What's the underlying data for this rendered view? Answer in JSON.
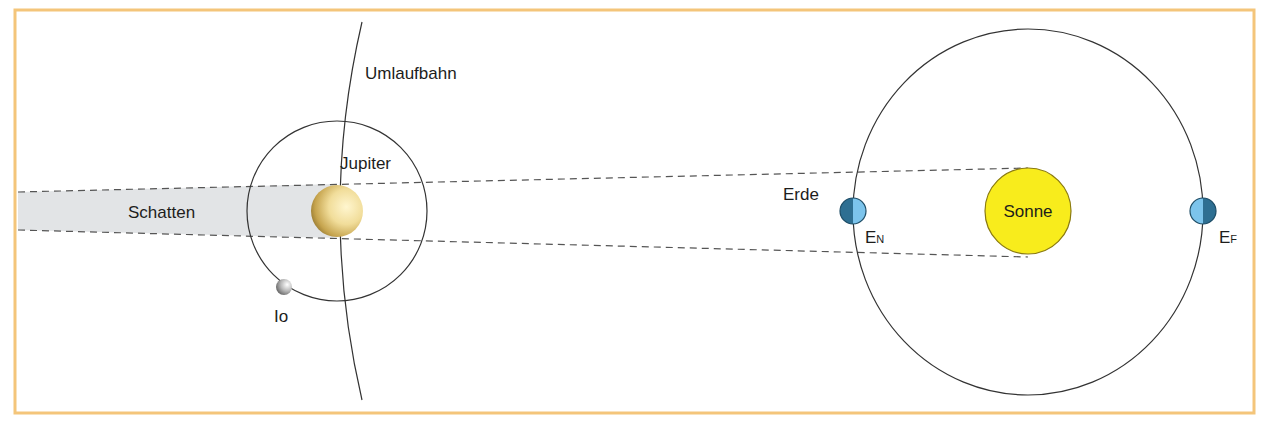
{
  "labels": {
    "orbit": "Umlaufbahn",
    "jupiter": "Jupiter",
    "shadow": "Schatten",
    "io": "Io",
    "earth": "Erde",
    "sun": "Sonne",
    "earth_near_main": "E",
    "earth_near_sub": "N",
    "earth_far_main": "E",
    "earth_far_sub": "F"
  },
  "colors": {
    "frame": "#f4c57a",
    "shadow_fill": "#e2e4e6",
    "sun_fill": "#f8ec1c",
    "sun_stroke": "#8a7a10",
    "earth_light": "#7cc4ec",
    "earth_dark": "#2e6f92",
    "line": "#333333",
    "dash": "#555555"
  }
}
